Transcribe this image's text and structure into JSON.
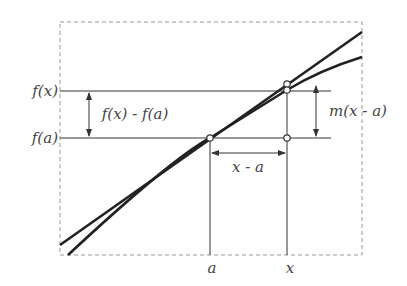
{
  "diagram": {
    "labels": {
      "fx": "f(x)",
      "fa": "f(a)",
      "difference": "f(x) - f(a)",
      "slope_term": "m(x - a)",
      "dx": "x - a",
      "a": "a",
      "x": "x"
    },
    "elements": {
      "curve": "y = f(x)",
      "tangent": "tangent line at a with slope m",
      "points": [
        "(a, f(a))",
        "(x, f(x))",
        "(x, f(a) + m(x - a))",
        "(x, f(a))"
      ]
    },
    "colors": {
      "line": "#222222",
      "frame": "#999999",
      "text": "#444444"
    }
  }
}
